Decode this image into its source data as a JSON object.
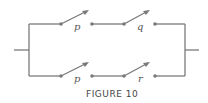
{
  "figure": {
    "caption": "FIGURE 10",
    "line_color": "#7a7a7a",
    "top_branch": {
      "switches": [
        {
          "label": "p"
        },
        {
          "label": "q"
        }
      ]
    },
    "bottom_branch": {
      "switches": [
        {
          "label": "p"
        },
        {
          "label": "r"
        }
      ]
    }
  }
}
